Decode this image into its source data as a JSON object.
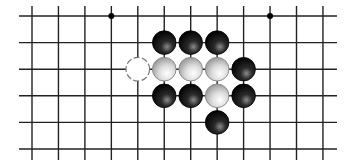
{
  "board": {
    "title": "Go board fragment",
    "columns": 12,
    "rows": 6,
    "origin_x": 32,
    "origin_y": 16,
    "spacing_x": 26.45,
    "spacing_y": 26.6,
    "line_extent": {
      "x1": 19,
      "x2": 337,
      "y1": 6,
      "y2": 160
    },
    "line_color": "#222222",
    "star_points": [
      {
        "col": 3,
        "row": 0
      },
      {
        "col": 9,
        "row": 0
      }
    ],
    "stones": [
      {
        "color": "black",
        "col": 5,
        "row": 1
      },
      {
        "color": "black",
        "col": 6,
        "row": 1
      },
      {
        "color": "black",
        "col": 7,
        "row": 1
      },
      {
        "color": "empty-marker",
        "col": 4,
        "row": 2
      },
      {
        "color": "white",
        "col": 5,
        "row": 2
      },
      {
        "color": "white",
        "col": 6,
        "row": 2
      },
      {
        "color": "white",
        "col": 7,
        "row": 2
      },
      {
        "color": "black",
        "col": 8,
        "row": 2
      },
      {
        "color": "black",
        "col": 5,
        "row": 3
      },
      {
        "color": "black",
        "col": 6,
        "row": 3
      },
      {
        "color": "white",
        "col": 7,
        "row": 3
      },
      {
        "color": "black",
        "col": 8,
        "row": 3
      },
      {
        "color": "black",
        "col": 7,
        "row": 4
      }
    ],
    "colors": {
      "black_stone_highlight": "#8a8a8a",
      "black_stone_base": "#000000",
      "white_stone_highlight": "#ffffff",
      "white_stone_base": "#9a9a9a",
      "white_stone_border": "#8c8c8c",
      "marker_border": "#777777"
    }
  }
}
